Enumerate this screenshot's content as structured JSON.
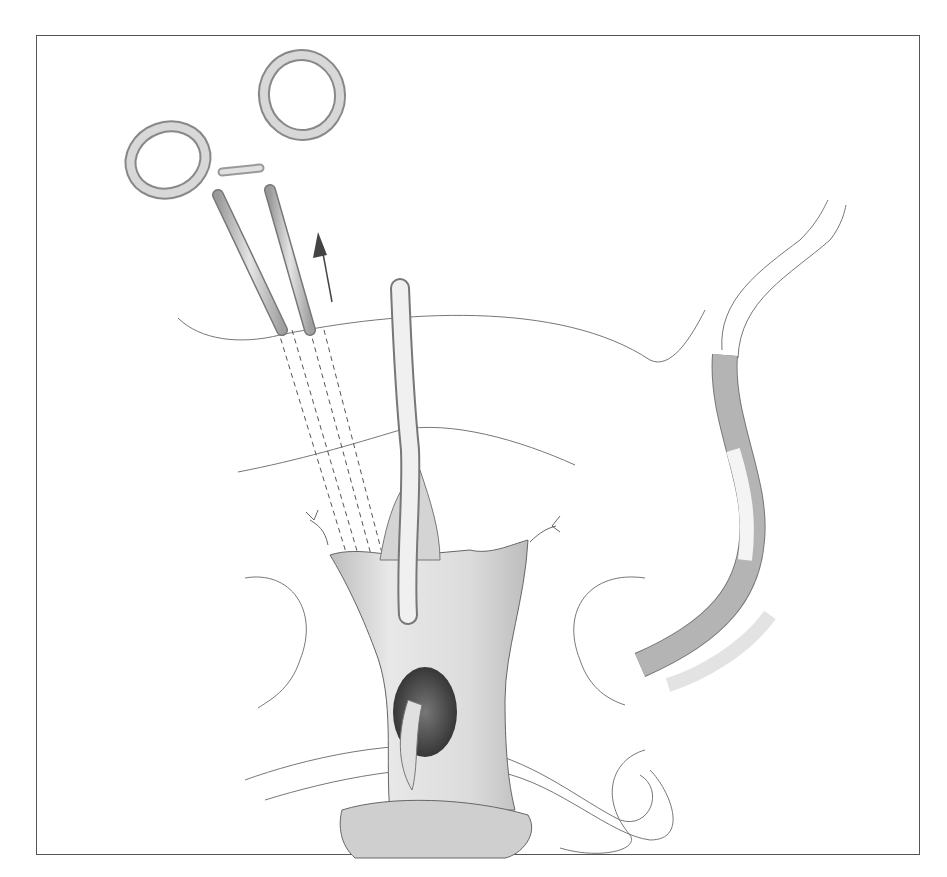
{
  "figure": {
    "type": "surgical-illustration",
    "elements": [
      "hemostat-forceps",
      "upward-arrow",
      "catheter-tube",
      "retracted-incision",
      "graft-tube",
      "sutures"
    ],
    "colors": {
      "line": "#555555",
      "metal": "#c8c8c8",
      "tube_dark": "#a9a9a9",
      "tube_light": "#e6e6e6",
      "cavity": "#3a3a3a"
    }
  }
}
